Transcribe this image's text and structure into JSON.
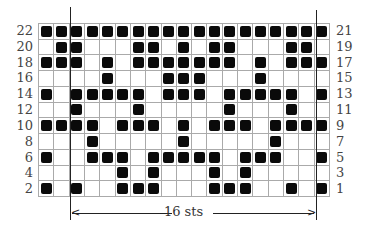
{
  "chart_data": {
    "type": "table",
    "columns": 19,
    "rows_visual": 11,
    "legend": {
      "filled": "contrast color stitch",
      "empty": "main color stitch"
    },
    "left_labels": [
      "22",
      "20",
      "18",
      "16",
      "14",
      "12",
      "10",
      "8",
      "6",
      "4",
      "2"
    ],
    "right_labels": [
      "21",
      "19",
      "17",
      "15",
      "13",
      "11",
      "9",
      "7",
      "5",
      "3",
      "1"
    ],
    "grid": [
      "1111111111111111111",
      "0110001101011000110",
      "1110101111111010111",
      "0000100011100010000",
      "1011111011101111101",
      "0010001000001000100",
      "1111011101011101111",
      "0001000001000001000",
      "1001110111110111001",
      "0000010100010100000",
      "1010011100011100101"
    ],
    "repeat": {
      "label": "16 sts",
      "start_col": 3,
      "end_col": 18
    }
  },
  "colors": {
    "filled": "#0a0a0a",
    "gridline": "#aaaaaa",
    "background": "#ffffff"
  }
}
